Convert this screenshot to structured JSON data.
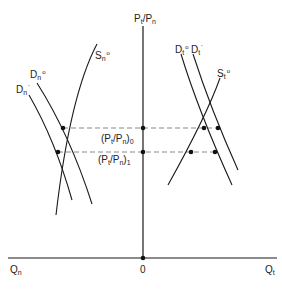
{
  "diagram": {
    "type": "economic supply-demand diagram (two-sector)",
    "axes": {
      "vertical": {
        "label_main": "P",
        "label_sub1": "t",
        "slash": "/",
        "label_main2": "P",
        "label_sub2": "n"
      },
      "horizontal_left": {
        "label_main": "Q",
        "label_sub": "n"
      },
      "horizontal_right": {
        "label_main": "Q",
        "label_sub": "t"
      },
      "origin": "0"
    },
    "price_levels": [
      {
        "label_open": "(P",
        "sub1": "t",
        "mid": "/P",
        "sub2": "n",
        "label_close": ")",
        "sub3": "0"
      },
      {
        "label_open": "(P",
        "sub1": "t",
        "mid": "/P",
        "sub2": "n",
        "label_close": ")",
        "sub3": "1"
      }
    ],
    "curves": {
      "Dn0": {
        "main": "D",
        "sub": "n",
        "sup": "o"
      },
      "Dn1": {
        "main": "D",
        "sub": "n",
        "sup": "'"
      },
      "Sn0": {
        "main": "S",
        "sub": "n",
        "sup": "o"
      },
      "Dt0": {
        "main": "D",
        "sub": "t",
        "sup": "o"
      },
      "Dt1": {
        "main": "D",
        "sub": "t",
        "sup": "'"
      },
      "St0": {
        "main": "S",
        "sub": "t",
        "sup": "o"
      }
    },
    "colors": {
      "line": "#1a1a1a",
      "dash": "#8a8a8a",
      "background": "#ffffff"
    }
  }
}
